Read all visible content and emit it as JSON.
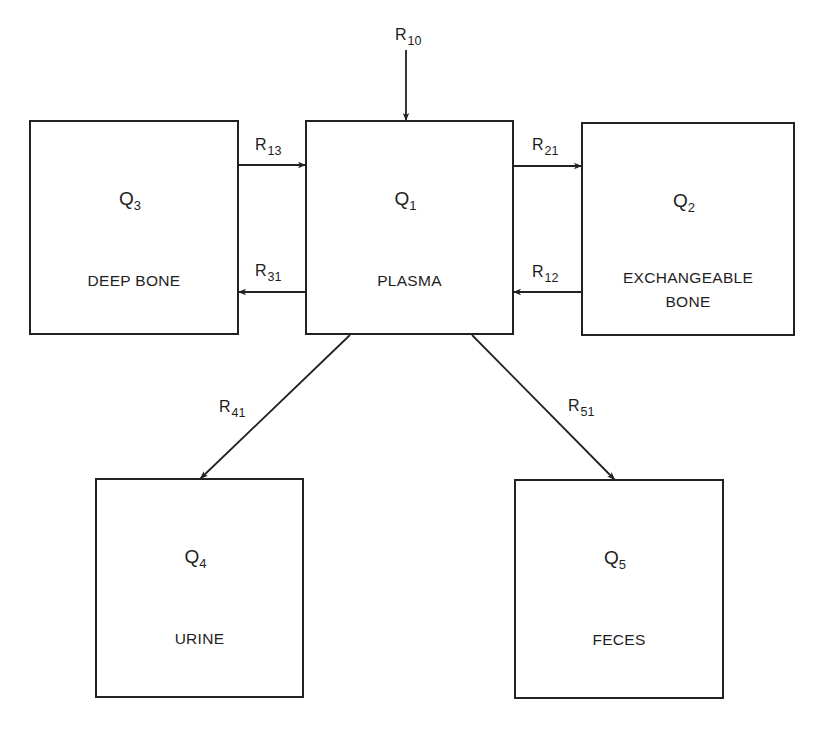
{
  "compartments": [
    {
      "id": "Q1",
      "symbol": "Q",
      "sub": "1",
      "name_lines": [
        "PLASMA"
      ],
      "x": 306,
      "y": 121,
      "w": 207,
      "h": 213
    },
    {
      "id": "Q2",
      "symbol": "Q",
      "sub": "2",
      "name_lines": [
        "EXCHANGEABLE",
        "BONE"
      ],
      "x": 582,
      "y": 123,
      "w": 212,
      "h": 212
    },
    {
      "id": "Q3",
      "symbol": "Q",
      "sub": "3",
      "name_lines": [
        "DEEP BONE"
      ],
      "x": 30,
      "y": 121,
      "w": 208,
      "h": 213
    },
    {
      "id": "Q4",
      "symbol": "Q",
      "sub": "4",
      "name_lines": [
        "URINE"
      ],
      "x": 96,
      "y": 479,
      "w": 207,
      "h": 218
    },
    {
      "id": "Q5",
      "symbol": "Q",
      "sub": "5",
      "name_lines": [
        "FECES"
      ],
      "x": 515,
      "y": 480,
      "w": 208,
      "h": 218
    }
  ],
  "flows": [
    {
      "id": "R10",
      "symbol": "R",
      "sub": "10",
      "from": "input",
      "to": "Q1",
      "x1": 406,
      "y1": 50,
      "x2": 406,
      "y2": 121,
      "lx": 395,
      "ly": 40
    },
    {
      "id": "R13",
      "symbol": "R",
      "sub": "13",
      "from": "Q3",
      "to": "Q1",
      "x1": 238,
      "y1": 165,
      "x2": 306,
      "y2": 165,
      "lx": 255,
      "ly": 150
    },
    {
      "id": "R31",
      "symbol": "R",
      "sub": "31",
      "from": "Q1",
      "to": "Q3",
      "x1": 306,
      "y1": 292,
      "x2": 238,
      "y2": 292,
      "lx": 255,
      "ly": 276
    },
    {
      "id": "R21",
      "symbol": "R",
      "sub": "21",
      "from": "Q1",
      "to": "Q2",
      "x1": 513,
      "y1": 166,
      "x2": 582,
      "y2": 166,
      "lx": 532,
      "ly": 150
    },
    {
      "id": "R12",
      "symbol": "R",
      "sub": "12",
      "from": "Q2",
      "to": "Q1",
      "x1": 582,
      "y1": 292,
      "x2": 513,
      "y2": 292,
      "lx": 532,
      "ly": 277
    },
    {
      "id": "R41",
      "symbol": "R",
      "sub": "41",
      "from": "Q1",
      "to": "Q4",
      "x1": 350,
      "y1": 335,
      "x2": 200,
      "y2": 479,
      "lx": 219,
      "ly": 412
    },
    {
      "id": "R51",
      "symbol": "R",
      "sub": "51",
      "from": "Q1",
      "to": "Q5",
      "x1": 472,
      "y1": 335,
      "x2": 615,
      "y2": 480,
      "lx": 568,
      "ly": 411
    }
  ],
  "colors": {
    "line": "#222222",
    "text": "#1e1e1e",
    "background": "#ffffff"
  }
}
